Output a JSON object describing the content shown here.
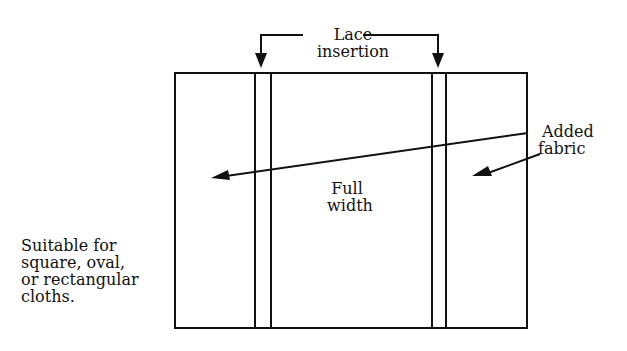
{
  "diagram": {
    "labels": {
      "lace_line1": "Lace",
      "lace_line2": "insertion",
      "added_line1": "Added",
      "added_line2": "fabric",
      "full_line1": "Full",
      "full_line2": "width",
      "note_line1": "Suitable for",
      "note_line2": "square, oval,",
      "note_line3": "or rectangular",
      "note_line4": "cloths."
    },
    "colors": {
      "stroke": "#111111",
      "background": "#ffffff"
    }
  }
}
